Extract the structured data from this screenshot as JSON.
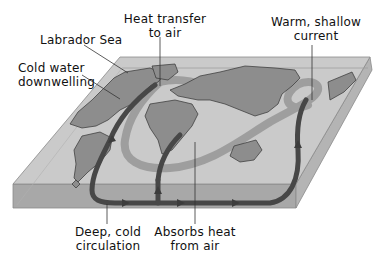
{
  "diagram": {
    "type": "ocean-conveyor-belt-thermohaline-circulation",
    "colors": {
      "background": "#ffffff",
      "slab_top": "#c8c8c8",
      "slab_front": "#a9a9a9",
      "slab_side": "#b5b5b5",
      "land": "#8e8e8e",
      "deep_current": "#4a4a4a",
      "shallow_current": "#9a9a9a",
      "label_text": "#111111",
      "leader_line": "#333333"
    },
    "labels": {
      "heat_transfer": {
        "line1": "Heat transfer",
        "line2": "to air"
      },
      "labrador_sea": {
        "line1": "Labrador Sea"
      },
      "cold_water": {
        "line1": "Cold water",
        "line2": "downwelling"
      },
      "warm_shallow": {
        "line1": "Warm, shallow",
        "line2": "current"
      },
      "deep_cold": {
        "line1": "Deep, cold",
        "line2": "circulation"
      },
      "absorbs_heat": {
        "line1": "Absorbs heat",
        "line2": "from air"
      }
    }
  }
}
